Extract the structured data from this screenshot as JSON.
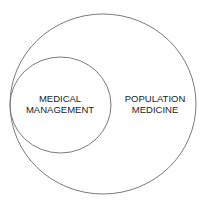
{
  "diagram": {
    "type": "nested-circles",
    "stroke_color": "#7a7a7a",
    "text_color": "#222222",
    "outer_circle": {
      "label_lines": [
        "POPULATION",
        "MEDICINE"
      ]
    },
    "inner_circle": {
      "label_lines": [
        "MEDICAL",
        "MANAGEMENT"
      ]
    }
  }
}
